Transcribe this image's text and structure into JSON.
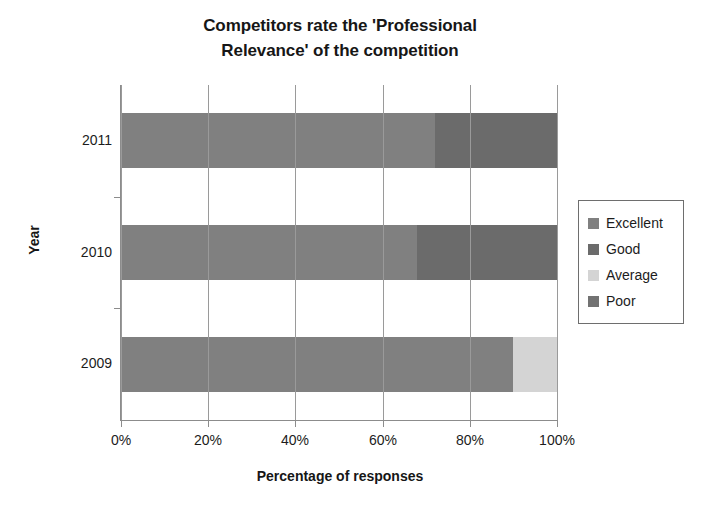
{
  "chart_data": {
    "type": "bar",
    "orientation": "horizontal",
    "stacked": true,
    "normalized": true,
    "title": "Competitors rate the 'Professional Relevance' of the competition",
    "title_lines": [
      "Competitors rate the 'Professional",
      "Relevance' of the competition"
    ],
    "xlabel": "Percentage of responses",
    "ylabel": "Year",
    "categories": [
      "2011",
      "2010",
      "2009"
    ],
    "xlim": [
      0,
      100
    ],
    "xticks": [
      0,
      20,
      40,
      60,
      80,
      100
    ],
    "xtick_labels": [
      "0%",
      "20%",
      "40%",
      "60%",
      "80%",
      "100%"
    ],
    "grid": true,
    "legend_position": "right",
    "series": [
      {
        "name": "Excellent",
        "color": "#808080",
        "values": [
          72,
          68,
          90
        ]
      },
      {
        "name": "Good",
        "color": "#6b6b6b",
        "values": [
          28,
          32,
          0
        ]
      },
      {
        "name": "Average",
        "color": "#d4d4d4",
        "values": [
          0,
          0,
          10
        ]
      },
      {
        "name": "Poor",
        "color": "#727272",
        "values": [
          0,
          0,
          0
        ]
      }
    ]
  },
  "legend": {
    "items": [
      {
        "label": "Excellent",
        "color": "#808080"
      },
      {
        "label": "Good",
        "color": "#6b6b6b"
      },
      {
        "label": "Average",
        "color": "#d4d4d4"
      },
      {
        "label": "Poor",
        "color": "#727272"
      }
    ]
  }
}
